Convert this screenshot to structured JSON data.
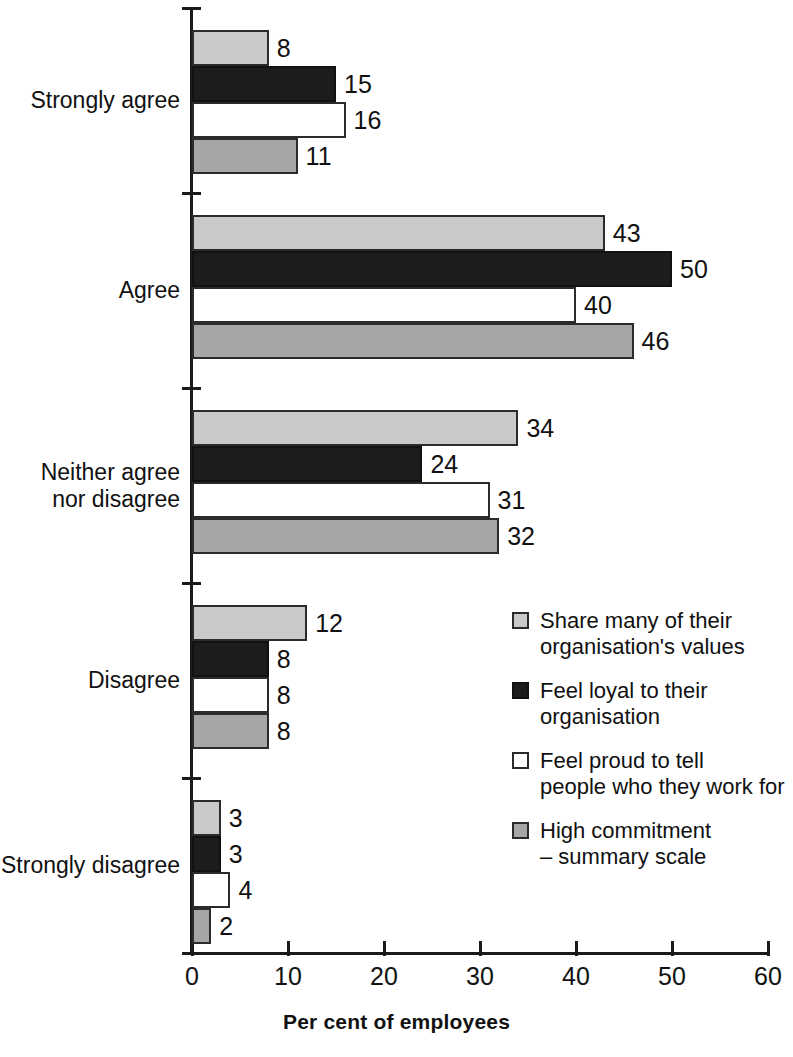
{
  "chart_data": {
    "type": "bar",
    "orientation": "horizontal",
    "title": "",
    "xlabel": "Per cent of employees",
    "ylabel": "",
    "xlim": [
      0,
      60
    ],
    "xticks": [
      0,
      10,
      20,
      30,
      40,
      50,
      60
    ],
    "xtick_labels": [
      "0",
      "10",
      "20",
      "30",
      "40",
      "50",
      "60"
    ],
    "grid": false,
    "legend_position": "inside-right",
    "categories": [
      "Strongly agree",
      "Agree",
      "Neither agree\nnor disagree",
      "Disagree",
      "Strongly disagree"
    ],
    "series": [
      {
        "name": "Share many of their\norganisation's values",
        "color": "#c9c9c9",
        "values": [
          8,
          43,
          34,
          12,
          3
        ]
      },
      {
        "name": "Feel loyal to their\norganisation",
        "color": "#1c1c1c",
        "values": [
          15,
          50,
          24,
          8,
          3
        ]
      },
      {
        "name": "Feel proud to tell\npeople who they work for",
        "color": "#ffffff",
        "values": [
          16,
          40,
          31,
          8,
          4
        ]
      },
      {
        "name": "High commitment\n– summary scale",
        "color": "#a6a6a6",
        "values": [
          11,
          46,
          32,
          8,
          2
        ]
      }
    ]
  },
  "axis": {
    "x_title": "Per cent of employees"
  },
  "colors": {
    "series_1": "#c9c9c9",
    "series_2": "#1c1c1c",
    "series_3": "#ffffff",
    "series_4": "#a6a6a6",
    "axis": "#1a1a1a",
    "text": "#111111"
  }
}
